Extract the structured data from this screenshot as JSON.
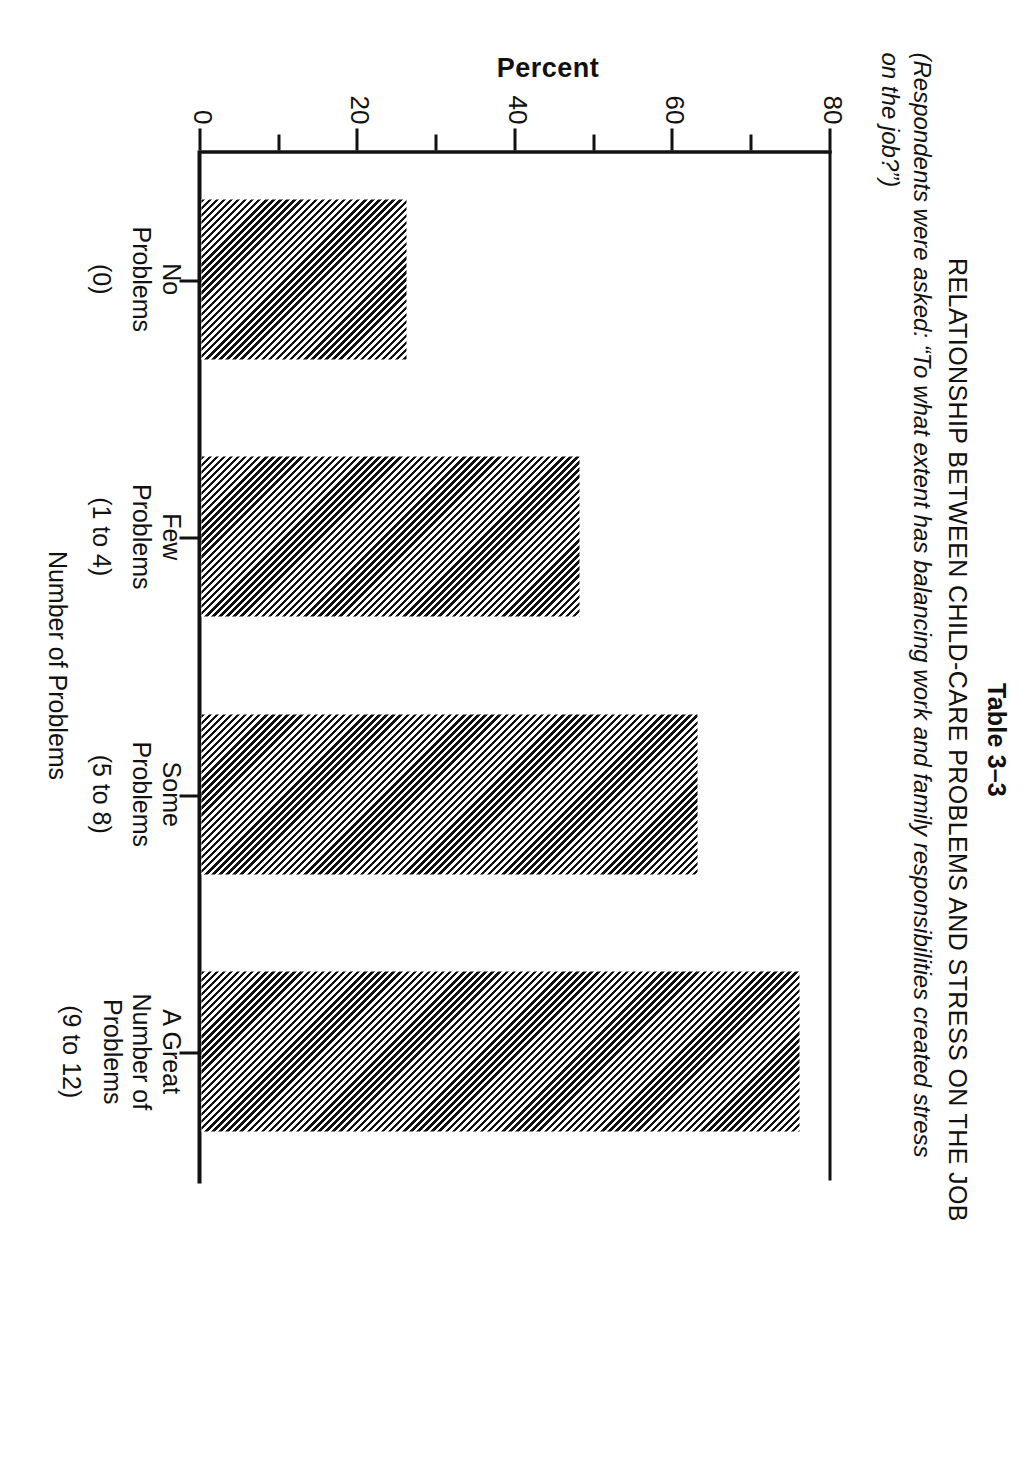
{
  "document": {
    "table_number": "Table 3–3",
    "title": "RELATIONSHIP BETWEEN CHILD-CARE PROBLEMS AND STRESS ON THE JOB",
    "subtitle_line1": "(Respondents were asked: “To what extent has balancing work and family responsibilities created stress",
    "subtitle_line2": "on the job?”)"
  },
  "chart_data": {
    "type": "bar",
    "orientation": "vertical",
    "title": "RELATIONSHIP BETWEEN CHILD-CARE PROBLEMS AND STRESS ON THE JOB",
    "subtitle": "(Respondents were asked: “To what extent has balancing work and family responsibilities created stress on the job?”)",
    "xlabel": "Number of Problems",
    "ylabel": "Percent",
    "ylim": [
      0,
      80
    ],
    "yticks": [
      0,
      20,
      40,
      60,
      80
    ],
    "ytick_labels": [
      "0",
      "20",
      "40",
      "60",
      "80"
    ],
    "minor_ytick_interval": 10,
    "grid": false,
    "legend": null,
    "bar_fill": "diagonal-hatch",
    "categories": [
      "No\nProblems",
      "Few\nProblems",
      "Some\nProblems",
      "A Great\nNumber of\nProblems"
    ],
    "category_ranges": [
      "(0)",
      "(1 to 4)",
      "(5 to 8)",
      "(9 to 12)"
    ],
    "values": [
      26,
      48,
      63,
      76
    ],
    "series": [
      {
        "name": "Percent reporting stress on the job",
        "values": [
          26,
          48,
          63,
          76
        ]
      }
    ]
  },
  "colors": {
    "ink": "#111111",
    "paper": "#ffffff"
  }
}
